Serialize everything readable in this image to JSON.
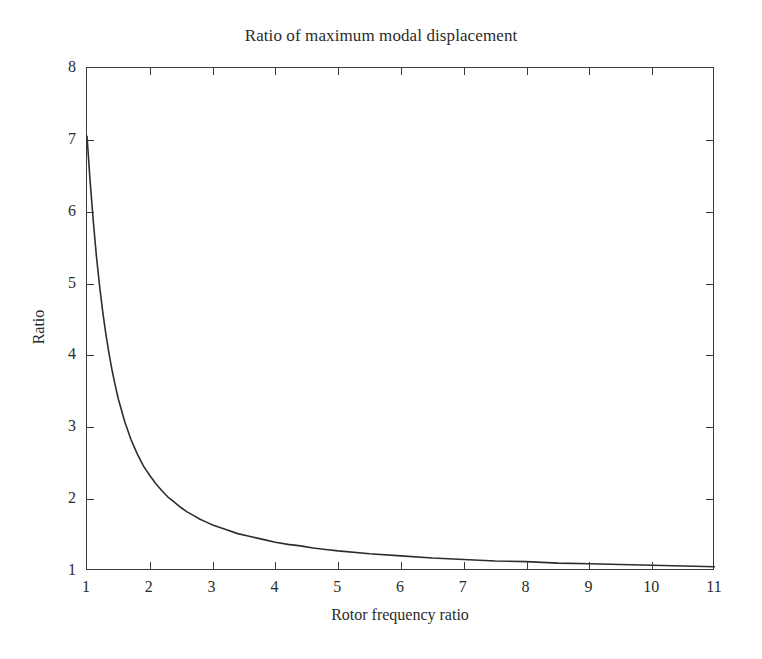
{
  "chart_data": {
    "type": "line",
    "title": "Ratio of maximum modal displacement",
    "xlabel": "Rotor frequency ratio",
    "ylabel": "Ratio",
    "xlim": [
      1,
      11
    ],
    "ylim": [
      1,
      8
    ],
    "grid": false,
    "legend": null,
    "xticks": [
      1,
      2,
      3,
      4,
      5,
      6,
      7,
      8,
      9,
      10,
      11
    ],
    "xticklabels": [
      "1",
      "2",
      "3",
      "4",
      "5",
      "6",
      "7",
      "8",
      "9",
      "10",
      "11"
    ],
    "yticks": [
      1,
      2,
      3,
      4,
      5,
      6,
      7,
      8
    ],
    "yticklabels": [
      "1",
      "2",
      "3",
      "4",
      "5",
      "6",
      "7",
      "8"
    ],
    "series": [
      {
        "name": "ratio",
        "color": "#2d2d2d",
        "linewidth": 1.6,
        "x": [
          1.0,
          1.05,
          1.1,
          1.15,
          1.2,
          1.25,
          1.3,
          1.35,
          1.4,
          1.45,
          1.5,
          1.6,
          1.7,
          1.8,
          1.9,
          2.0,
          2.1,
          2.2,
          2.3,
          2.4,
          2.5,
          2.6,
          2.7,
          2.8,
          2.9,
          3.0,
          3.2,
          3.4,
          3.6,
          3.8,
          4.0,
          4.2,
          4.4,
          4.6,
          4.8,
          5.0,
          5.5,
          6.0,
          6.5,
          7.0,
          7.5,
          8.0,
          8.5,
          9.0,
          9.5,
          10.0,
          10.5,
          11.0
        ],
        "y": [
          7.05,
          6.42,
          5.87,
          5.38,
          4.97,
          4.61,
          4.3,
          4.03,
          3.79,
          3.58,
          3.39,
          3.08,
          2.83,
          2.63,
          2.46,
          2.33,
          2.21,
          2.11,
          2.02,
          1.95,
          1.88,
          1.82,
          1.77,
          1.72,
          1.68,
          1.64,
          1.58,
          1.52,
          1.48,
          1.44,
          1.4,
          1.37,
          1.35,
          1.32,
          1.3,
          1.28,
          1.24,
          1.21,
          1.18,
          1.16,
          1.14,
          1.13,
          1.11,
          1.1,
          1.09,
          1.08,
          1.07,
          1.06
        ]
      }
    ]
  }
}
